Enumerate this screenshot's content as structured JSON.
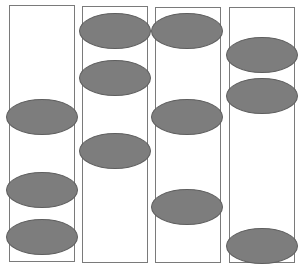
{
  "diagram": {
    "colors": {
      "column_border": "#7a7a7a",
      "ellipse_fill": "#7d7d7d",
      "ellipse_border": "#5e5e5e",
      "background": "#ffffff"
    },
    "columns": [
      {
        "x": 9,
        "y": 5,
        "w": 66,
        "h": 257,
        "ellipses": [
          {
            "cx": 42,
            "cy": 117
          },
          {
            "cx": 42,
            "cy": 190
          },
          {
            "cx": 42,
            "cy": 237
          }
        ]
      },
      {
        "x": 82,
        "y": 6,
        "w": 66,
        "h": 257,
        "ellipses": [
          {
            "cx": 115,
            "cy": 31
          },
          {
            "cx": 115,
            "cy": 78
          },
          {
            "cx": 115,
            "cy": 151
          }
        ]
      },
      {
        "x": 155,
        "y": 7,
        "w": 66,
        "h": 256,
        "ellipses": [
          {
            "cx": 187,
            "cy": 31
          },
          {
            "cx": 187,
            "cy": 117
          },
          {
            "cx": 187,
            "cy": 207
          }
        ]
      },
      {
        "x": 229,
        "y": 7,
        "w": 66,
        "h": 256,
        "ellipses": [
          {
            "cx": 262,
            "cy": 55
          },
          {
            "cx": 262,
            "cy": 96
          },
          {
            "cx": 262,
            "cy": 246
          }
        ]
      }
    ],
    "ellipse_size": {
      "w": 72,
      "h": 36
    }
  }
}
